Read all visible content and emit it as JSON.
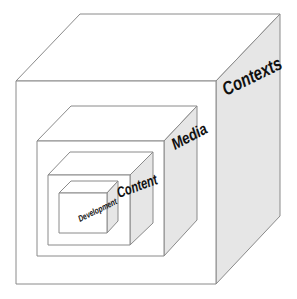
{
  "diagram": {
    "type": "nested-cubes",
    "colors": {
      "background": "#ffffff",
      "front_face": "#ffffff",
      "top_face": "#ffffff",
      "side_face": "#e6e6e6",
      "edge": "#8a8a8a",
      "label": "#111111"
    },
    "cubes": [
      {
        "id": "contexts",
        "label": "Contexts"
      },
      {
        "id": "media",
        "label": "Media"
      },
      {
        "id": "content",
        "label": "Content"
      },
      {
        "id": "development",
        "label": "Development"
      }
    ]
  }
}
